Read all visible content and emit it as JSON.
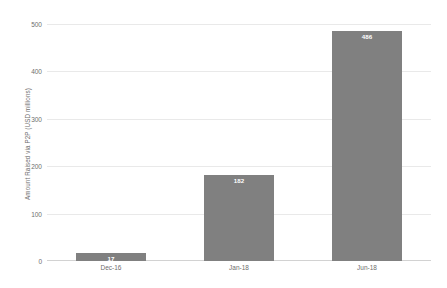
{
  "chart_data": {
    "type": "bar",
    "title": "",
    "subtitle": "",
    "xlabel": "",
    "ylabel": "Amount Raised via P2P (USD millions)",
    "categories": [
      "Dec-16",
      "Jan-18",
      "Jun-18"
    ],
    "values": [
      17,
      182,
      486
    ],
    "value_labels": [
      "17",
      "182",
      "486"
    ],
    "ylim": [
      0,
      500
    ],
    "y_ticks": [
      0,
      100,
      200,
      300,
      400,
      500
    ],
    "y_tick_labels": [
      "0",
      "100",
      "200",
      "300",
      "400",
      "500"
    ],
    "grid": true,
    "grid_axis": "y",
    "legend": false,
    "legend_position": "none",
    "series": [
      {
        "name": "Amount Raised via P2P",
        "values": [
          17,
          182,
          486
        ],
        "color": "#808080"
      }
    ],
    "colors": {
      "bar": "#808080",
      "gridline": "#e9e9e9",
      "axis": "#d2d2d2",
      "tick_text": "#6e6e6e",
      "value_label_text": "#ffffff",
      "background": "#ffffff"
    }
  }
}
